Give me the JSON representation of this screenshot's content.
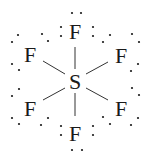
{
  "molecule": {
    "formula": "SF6",
    "central_atom": {
      "symbol": "S",
      "x": 75,
      "y": 81
    },
    "ligands": [
      {
        "id": "top",
        "symbol": "F",
        "x": 75,
        "y": 31,
        "bond": [
          75,
          47,
          75,
          69
        ],
        "dots": [
          [
            72,
            13
          ],
          [
            81,
            13
          ],
          [
            61,
            27
          ],
          [
            61,
            36
          ],
          [
            93,
            27
          ],
          [
            93,
            36
          ]
        ]
      },
      {
        "id": "upper-left",
        "symbol": "F",
        "x": 30,
        "y": 54,
        "bond": [
          43,
          61,
          65,
          74
        ],
        "dots": [
          [
            18,
            35
          ],
          [
            12,
            42
          ],
          [
            42,
            34
          ],
          [
            48,
            41
          ],
          [
            12,
            64
          ],
          [
            19,
            70
          ]
        ]
      },
      {
        "id": "upper-right",
        "symbol": "F",
        "x": 121,
        "y": 55,
        "bond": [
          108,
          62,
          86,
          74
        ],
        "dots": [
          [
            110,
            35
          ],
          [
            103,
            42
          ],
          [
            132,
            34
          ],
          [
            139,
            42
          ],
          [
            138,
            64
          ],
          [
            131,
            71
          ]
        ]
      },
      {
        "id": "lower-left",
        "symbol": "F",
        "x": 30,
        "y": 108,
        "bond": [
          65,
          88,
          43,
          100
        ],
        "dots": [
          [
            19,
            89
          ],
          [
            12,
            96
          ],
          [
            12,
            118
          ],
          [
            19,
            124
          ],
          [
            41,
            125
          ],
          [
            48,
            118
          ]
        ]
      },
      {
        "id": "lower-right",
        "symbol": "F",
        "x": 121,
        "y": 108,
        "bond": [
          86,
          88,
          108,
          100
        ],
        "dots": [
          [
            132,
            88
          ],
          [
            139,
            95
          ],
          [
            103,
            117
          ],
          [
            110,
            124
          ],
          [
            138,
            118
          ],
          [
            131,
            125
          ]
        ]
      },
      {
        "id": "bottom",
        "symbol": "F",
        "x": 75,
        "y": 133,
        "bond": [
          75,
          93,
          75,
          116
        ],
        "dots": [
          [
            61,
            126
          ],
          [
            61,
            135
          ],
          [
            93,
            126
          ],
          [
            93,
            135
          ],
          [
            72,
            150
          ],
          [
            82,
            150
          ]
        ]
      }
    ]
  },
  "colors": {
    "ink": "#1a1a1a",
    "bond": "#333333",
    "background": "#ffffff"
  }
}
